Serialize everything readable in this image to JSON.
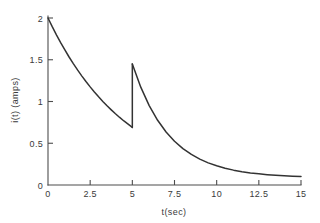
{
  "chart_data": {
    "type": "line",
    "title": "",
    "xlabel": "t(sec)",
    "ylabel": "i(t) (amps)",
    "xlim": [
      0,
      15
    ],
    "ylim": [
      0,
      2
    ],
    "grid": false,
    "legend": null,
    "xticks": [
      0,
      2.5,
      5,
      7.5,
      10,
      12.5,
      15
    ],
    "xtick_labels": [
      "0",
      "2.5",
      "5",
      "7.5",
      "10",
      "12.5",
      "15"
    ],
    "yticks": [
      0,
      0.5,
      1,
      1.5,
      2
    ],
    "ytick_labels": [
      "0",
      "0.5",
      "1",
      "1.5",
      "2"
    ],
    "annotations": [
      {
        "text": "discontinuity at t = 5 sec: drops to 0.69, jumps to 1.45"
      }
    ],
    "series": [
      {
        "name": "i(t) segment 1",
        "comment": "2.00*exp(-0.2128*t) for 0 <= t < 5",
        "x": [
          0.0,
          0.25,
          0.5,
          0.75,
          1.0,
          1.25,
          1.5,
          1.75,
          2.0,
          2.25,
          2.5,
          2.75,
          3.0,
          3.25,
          3.5,
          3.75,
          4.0,
          4.25,
          4.5,
          4.75,
          5.0
        ],
        "y": [
          2.0,
          1.896,
          1.798,
          1.705,
          1.617,
          1.533,
          1.453,
          1.378,
          1.307,
          1.239,
          1.175,
          1.114,
          1.056,
          1.001,
          0.949,
          0.9,
          0.853,
          0.809,
          0.767,
          0.728,
          0.69
        ]
      },
      {
        "name": "i(t) segment 2",
        "comment": "1.45*exp(-0.46*(t-5)) + 0.02 for 5 <= t <= 15",
        "x": [
          5.0,
          5.5,
          6.0,
          6.5,
          7.0,
          7.5,
          8.0,
          8.5,
          9.0,
          9.5,
          10.0,
          10.5,
          11.0,
          11.5,
          12.0,
          12.5,
          13.0,
          13.5,
          14.0,
          14.5,
          15.0
        ],
        "y": [
          1.45,
          1.172,
          0.951,
          0.775,
          0.635,
          0.524,
          0.436,
          0.366,
          0.31,
          0.265,
          0.23,
          0.201,
          0.178,
          0.16,
          0.145,
          0.134,
          0.124,
          0.116,
          0.11,
          0.105,
          0.101
        ]
      }
    ],
    "vertical_jump": {
      "x": 5,
      "y_from": 0.69,
      "y_to": 1.45
    },
    "colors": {
      "curve": "#333333",
      "axis": "#4d4d4d",
      "background": "#ffffff"
    }
  }
}
